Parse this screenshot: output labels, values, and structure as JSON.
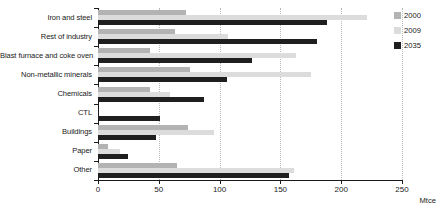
{
  "chart_data": {
    "type": "bar",
    "orientation": "horizontal",
    "title": "",
    "xlabel": "Mtce",
    "ylabel": "",
    "xlim": [
      0,
      250
    ],
    "xticks": [
      0,
      50,
      100,
      150,
      200,
      250
    ],
    "xtick_labels": [
      "0",
      "50",
      "100",
      "150",
      "200",
      "250"
    ],
    "grid": true,
    "grid_axis": "x",
    "legend_position": "right",
    "categories": [
      "Iron and steel",
      "Rest of industry",
      "Blast furnace and coke oven",
      "Non-metallic minerals",
      "Chemicals",
      "CTL",
      "Buildings",
      "Paper",
      "Other"
    ],
    "series": [
      {
        "name": "2000",
        "color": "#b3b3b3",
        "values": [
          72,
          63,
          43,
          76,
          43,
          0,
          74,
          8,
          65
        ]
      },
      {
        "name": "2009",
        "color": "#dcdcdc",
        "values": [
          221,
          107,
          163,
          175,
          59,
          0,
          95,
          18,
          161
        ]
      },
      {
        "name": "2035",
        "color": "#1f1f1f",
        "values": [
          188,
          180,
          127,
          106,
          87,
          51,
          48,
          25,
          157
        ]
      }
    ]
  },
  "legend": {
    "items": [
      {
        "label": "2000",
        "swatch": "legend-swatch-2000"
      },
      {
        "label": "2009",
        "swatch": "legend-swatch-2009"
      },
      {
        "label": "2035",
        "swatch": "legend-swatch-2035"
      }
    ]
  },
  "axis": {
    "unit": "Mtce"
  }
}
